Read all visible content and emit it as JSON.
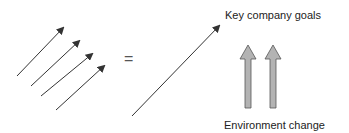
{
  "diagram": {
    "equals_symbol": "=",
    "goals_label": "Key company goals",
    "environment_label": "Environment change",
    "colors": {
      "line": "#333333",
      "block_arrow_fill": "#b3b3b3",
      "block_arrow_stroke": "#555555",
      "text": "#222222"
    },
    "parallel_arrows_count": 4,
    "block_arrows_count": 2
  }
}
